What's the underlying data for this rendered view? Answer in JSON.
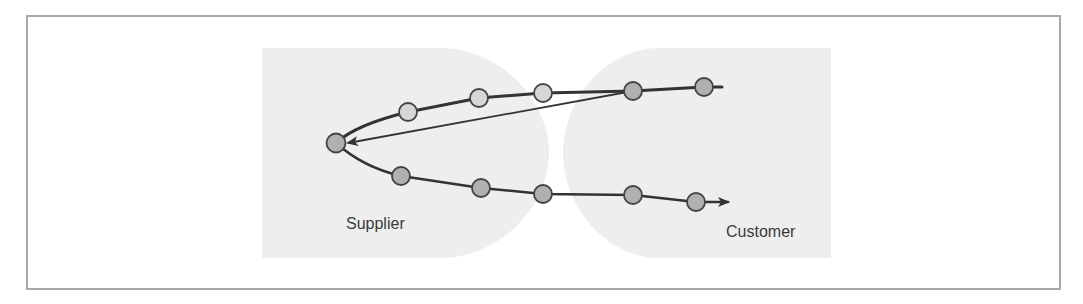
{
  "diagram": {
    "type": "flow-loop",
    "labels": {
      "supplier": "Supplier",
      "customer": "Customer"
    },
    "colors": {
      "frame_border": "#a8a8a8",
      "region_fill": "#eeeeee",
      "line": "#333333",
      "node_light": "#d6d6d6",
      "node_dark": "#b0b0b0",
      "node_stroke": "#444444",
      "label_text": "#3a3a3a"
    },
    "regions": [
      {
        "name": "Supplier",
        "x_range": [
          262,
          549
        ],
        "y_range": [
          48,
          258
        ]
      },
      {
        "name": "Customer",
        "x_range": [
          563,
          831
        ],
        "y_range": [
          48,
          258
        ]
      }
    ],
    "upper_path_nodes": [
      {
        "x": 704,
        "y": 87,
        "shade": "dark"
      },
      {
        "x": 633,
        "y": 91,
        "shade": "dark"
      },
      {
        "x": 543,
        "y": 93,
        "shade": "light"
      },
      {
        "x": 479,
        "y": 98,
        "shade": "light"
      },
      {
        "x": 408,
        "y": 112,
        "shade": "light"
      }
    ],
    "apex_node": {
      "x": 336,
      "y": 143,
      "shade": "dark"
    },
    "lower_path_nodes": [
      {
        "x": 401,
        "y": 176,
        "shade": "dark"
      },
      {
        "x": 481,
        "y": 188,
        "shade": "dark"
      },
      {
        "x": 543,
        "y": 194,
        "shade": "dark"
      },
      {
        "x": 633,
        "y": 195,
        "shade": "dark"
      },
      {
        "x": 696,
        "y": 202,
        "shade": "dark"
      }
    ],
    "shortcut_arrow": {
      "from": {
        "x": 633,
        "y": 91
      },
      "to": {
        "x": 346,
        "y": 143
      }
    },
    "output_arrow_tip": {
      "x": 728,
      "y": 202
    }
  }
}
